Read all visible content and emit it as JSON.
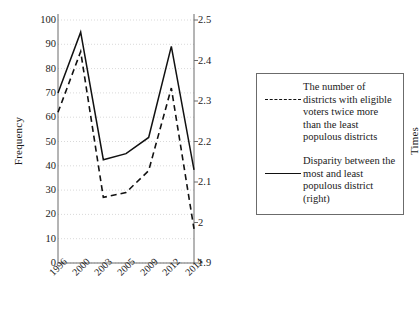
{
  "chart_data": {
    "type": "line",
    "title": "",
    "xlabel": "",
    "categories": [
      "1996",
      "2000",
      "2003",
      "2005",
      "2009",
      "2012",
      "2014"
    ],
    "grid": true,
    "legend_position": "right",
    "axes": {
      "left": {
        "label": "Frequency",
        "ylim": [
          0,
          100
        ],
        "ticks": [
          "0",
          "10",
          "20",
          "30",
          "40",
          "50",
          "60",
          "70",
          "80",
          "90",
          "100"
        ],
        "tick_values": [
          0,
          10,
          20,
          30,
          40,
          50,
          60,
          70,
          80,
          90,
          100
        ]
      },
      "right": {
        "label": "Times",
        "ylim": [
          1.9,
          2.5
        ],
        "ticks": [
          "1.9",
          "2",
          "2.1",
          "2.2",
          "2.3",
          "2.4",
          "2.5"
        ],
        "tick_values": [
          1.9,
          2.0,
          2.1,
          2.2,
          2.3,
          2.4,
          2.5
        ]
      }
    },
    "series": [
      {
        "name": "The number of districts with eligible voters twice more than the least populous districts",
        "style": "dashed",
        "axis": "left",
        "color": "#111111",
        "values": [
          62,
          87,
          27,
          29,
          38,
          72,
          14
        ]
      },
      {
        "name": "Disparity between the most and least populous district (right)",
        "style": "solid",
        "axis": "right",
        "color": "#111111",
        "values": [
          2.32,
          2.47,
          2.155,
          2.17,
          2.21,
          2.435,
          2.13
        ]
      }
    ]
  },
  "legend": {
    "entries": [
      {
        "key": "dashed-line-key",
        "text": "The number of districts with eligible voters twice more than the least populous districts"
      },
      {
        "key": "solid-line-key",
        "text": "Disparity between the most and least populous district (right)"
      }
    ]
  },
  "colors": {
    "line": "#111111",
    "grid": "#cfcfcf",
    "axis": "#6b6b6b",
    "legend_border": "#6b6b6b",
    "background": "#ffffff"
  }
}
